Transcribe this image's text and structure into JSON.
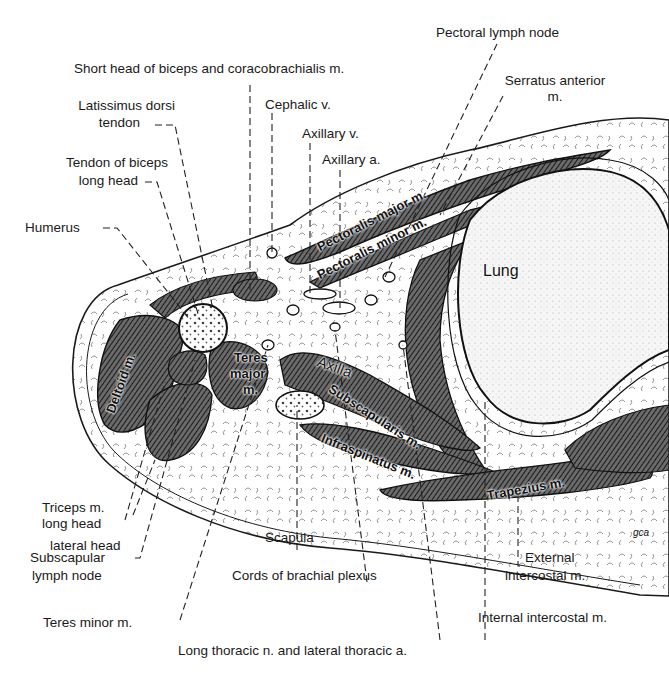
{
  "figure": {
    "signature": "gca"
  },
  "labels": {
    "pectoral_lymph_node": "Pectoral lymph node",
    "short_head_biceps": "Short head of biceps and coracobrachialis m.",
    "serratus_anterior_1": "Serratus anterior",
    "serratus_anterior_2": "m.",
    "latissimus_1": "Latissimus dorsi",
    "latissimus_2": "tendon",
    "cephalic_v": "Cephalic v.",
    "axillary_v": "Axillary v.",
    "axillary_a": "Axillary a.",
    "tendon_biceps_1": "Tendon of biceps",
    "tendon_biceps_2": "long head",
    "humerus": "Humerus",
    "triceps_1": "Triceps m.",
    "triceps_2": "long head",
    "lateral_head": "lateral head",
    "subscapular_ln_1": "Subscapular",
    "subscapular_ln_2": "lymph node",
    "teres_minor": "Teres minor m.",
    "scapula": "Scapula",
    "cords_brachial": "Cords of brachial plexus",
    "long_thoracic": "Long thoracic n. and lateral thoracic a.",
    "external_ic_1": "External",
    "external_ic_2": "intercostal m.",
    "internal_ic": "Internal intercostal m."
  },
  "inline_labels": {
    "lung": "Lung",
    "deltoid": "Deltoid m.",
    "teres_major_1": "Teres",
    "teres_major_2": "major",
    "teres_major_3": "m.",
    "pectoralis_major": "Pectoralis major m.",
    "pectoralis_minor": "Pectoralis minor m.",
    "axilla": "Axilla",
    "subscapularis": "Subscapularis m.",
    "infraspinatus": "Infraspinatus m.",
    "trapezius": "Trapezius m."
  },
  "colors": {
    "ink": "#1a1a1a",
    "muscle_fill": "#4a4a4a",
    "paper": "#ffffff",
    "lung_fill": "#f4f4f4"
  }
}
